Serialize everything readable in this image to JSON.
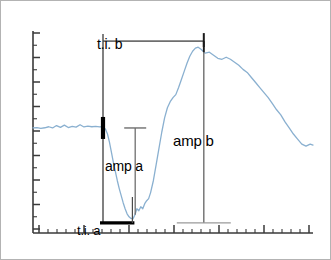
{
  "figure": {
    "title": "",
    "background_color": "#ffffff",
    "border_color": "#b3b3b3",
    "waveform_color": "#8ab0d0",
    "axis_color": "#3a3a3a",
    "annotation_line_color": "#6e6e6e",
    "marker_color": "#000000"
  },
  "annotations": {
    "ti_b": "t.i. b",
    "ti_a": "t.i. a",
    "amp_a": "amp a",
    "amp_b": "amp b"
  },
  "chart_data": {
    "type": "line",
    "title": "",
    "xlabel": "",
    "ylabel": "",
    "xlim": [
      0,
      100
    ],
    "ylim": [
      0,
      100
    ],
    "grid": false,
    "legend": false,
    "axes": {
      "x_axis": {
        "visible": true,
        "position": "bottom",
        "tick_count": 31,
        "major_every": 5,
        "minor_tick_length": 4,
        "major_tick_length": 8
      },
      "y_axis": {
        "visible": true,
        "position": "left",
        "tick_count": 17,
        "major_every": 2,
        "minor_tick_length": 4,
        "major_tick_length": 7
      }
    },
    "series": [
      {
        "name": "signal",
        "color": "#8ab0d0",
        "x": [
          0.0,
          1.4,
          2.8,
          4.2,
          5.6,
          7.0,
          8.4,
          9.8,
          11.2,
          12.6,
          14.0,
          15.4,
          16.8,
          18.2,
          19.6,
          21.0,
          22.4,
          23.8,
          24.5,
          25.2,
          25.9,
          26.6,
          27.3,
          28.0,
          28.7,
          29.4,
          30.1,
          30.8,
          31.5,
          32.2,
          32.9,
          33.6,
          34.3,
          35.0,
          35.7,
          36.4,
          37.1,
          37.8,
          38.5,
          39.2,
          39.9,
          40.6,
          41.3,
          42.0,
          43.0,
          44.0,
          45.0,
          46.0,
          47.0,
          48.0,
          49.0,
          50.0,
          51.0,
          52.0,
          53.0,
          54.0,
          55.0,
          56.0,
          57.0,
          58.0,
          59.0,
          60.0,
          61.5,
          63.0,
          64.5,
          66.0,
          67.5,
          69.0,
          70.5,
          72.0,
          73.5,
          75.0,
          76.5,
          78.0,
          79.5,
          81.0,
          82.5,
          84.0,
          85.5,
          87.0,
          88.5,
          90.0,
          91.5,
          93.0,
          94.5,
          96.0,
          97.5,
          99.0,
          100.0
        ],
        "y": [
          52.0,
          52.2,
          51.8,
          52.1,
          52.6,
          52.0,
          53.2,
          52.3,
          53.4,
          52.2,
          52.8,
          52.4,
          53.6,
          52.5,
          52.9,
          52.6,
          52.8,
          52.5,
          52.6,
          52.3,
          51.4,
          49.0,
          45.0,
          40.0,
          35.0,
          30.5,
          26.0,
          22.0,
          18.5,
          15.0,
          12.0,
          9.5,
          8.0,
          7.2,
          7.0,
          9.0,
          12.0,
          11.0,
          13.0,
          12.0,
          14.5,
          16.0,
          17.0,
          20.0,
          26.0,
          34.0,
          42.0,
          50.0,
          57.0,
          62.0,
          65.0,
          67.0,
          68.5,
          72.0,
          76.0,
          80.0,
          84.0,
          87.5,
          90.0,
          91.5,
          92.0,
          91.0,
          89.0,
          89.5,
          88.0,
          86.5,
          86.0,
          87.0,
          86.0,
          84.5,
          83.0,
          81.0,
          79.5,
          77.0,
          74.5,
          72.0,
          69.5,
          67.0,
          64.0,
          61.0,
          58.5,
          55.0,
          52.0,
          49.0,
          46.5,
          44.0,
          43.0,
          44.0,
          43.5
        ]
      }
    ],
    "measurements": [
      {
        "id": "ti_b",
        "label": "t.i. b",
        "kind": "horizontal-interval",
        "description": "time interval from signal onset to positive peak",
        "x_start": 25.0,
        "x_end": 61.0,
        "y_level": 95.0
      },
      {
        "id": "ti_a",
        "label": "t.i. a",
        "kind": "horizontal-interval",
        "description": "time interval from signal onset to negative trough",
        "x_start": 25.0,
        "x_end": 35.5,
        "y_level": 5.0
      },
      {
        "id": "amp_a",
        "label": "amp a",
        "kind": "vertical-amplitude",
        "description": "amplitude of the negative deflection",
        "x_at": 36.5,
        "y_top": 52.0,
        "y_bottom": 9.0
      },
      {
        "id": "amp_b",
        "label": "amp b",
        "kind": "vertical-amplitude",
        "description": "amplitude of the positive peak",
        "x_at": 61.0,
        "y_top": 92.0,
        "y_bottom": 5.0
      }
    ],
    "markers": [
      {
        "id": "onset-marker",
        "description": "thick black marker at signal onset on baseline",
        "x": 25.0,
        "y": 52.0
      },
      {
        "id": "peak-marker",
        "description": "short black tick at the positive peak",
        "x": 61.0,
        "y": 92.0
      }
    ]
  }
}
